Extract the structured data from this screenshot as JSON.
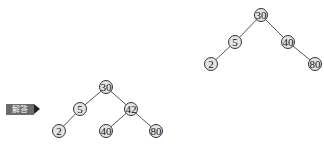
{
  "answer_label": "解答",
  "trees": [
    {
      "name": "top-right-tree",
      "nodes": [
        {
          "id": "r30",
          "value": "30",
          "x": 261,
          "y": 15
        },
        {
          "id": "r5",
          "value": "5",
          "x": 235,
          "y": 42
        },
        {
          "id": "r40",
          "value": "40",
          "x": 288,
          "y": 42
        },
        {
          "id": "r2",
          "value": "2",
          "x": 211,
          "y": 64
        },
        {
          "id": "r80",
          "value": "80",
          "x": 315,
          "y": 64
        }
      ],
      "edges": [
        [
          "r30",
          "r5"
        ],
        [
          "r30",
          "r40"
        ],
        [
          "r5",
          "r2"
        ],
        [
          "r40",
          "r80"
        ]
      ]
    },
    {
      "name": "bottom-left-tree",
      "nodes": [
        {
          "id": "l30",
          "value": "30",
          "x": 106,
          "y": 87
        },
        {
          "id": "l5",
          "value": "5",
          "x": 80,
          "y": 109
        },
        {
          "id": "l42",
          "value": "42",
          "x": 131,
          "y": 109
        },
        {
          "id": "l2",
          "value": "2",
          "x": 59,
          "y": 131
        },
        {
          "id": "l40",
          "value": "40",
          "x": 106,
          "y": 131
        },
        {
          "id": "l80",
          "value": "80",
          "x": 156,
          "y": 131
        }
      ],
      "edges": [
        [
          "l30",
          "l5"
        ],
        [
          "l30",
          "l42"
        ],
        [
          "l5",
          "l2"
        ],
        [
          "l42",
          "l40"
        ],
        [
          "l42",
          "l80"
        ]
      ]
    }
  ]
}
